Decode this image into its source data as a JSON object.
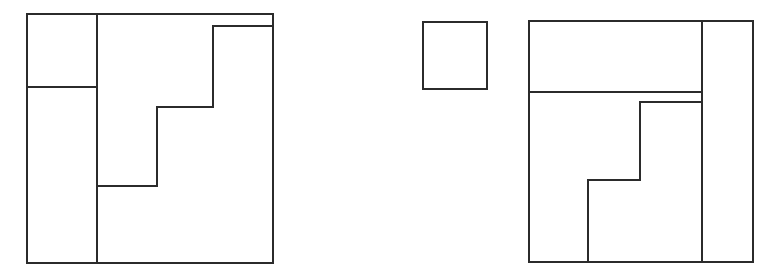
{
  "page": {
    "background_color": "#ffffff",
    "stroke_color": "#2b2b2b",
    "stroke_width": 2,
    "width": 779,
    "height": 280
  },
  "figures": [
    {
      "id": "left-figure",
      "name": "left-partitioned-square",
      "label": "Left figure: square partitioned into four rectilinear regions",
      "outer_rect": {
        "x": 27,
        "y": 14,
        "width": 246,
        "height": 249
      },
      "regions": [
        {
          "name": "top-left-small-rectangle",
          "x": 27,
          "y": 14,
          "width": 70,
          "height": 73
        },
        {
          "name": "left-tall-rectangle",
          "x": 27,
          "y": 87,
          "width": 70,
          "height": 176
        },
        {
          "name": "staircase-left-region",
          "x": 97,
          "y": 14,
          "width": 116,
          "height": 249
        },
        {
          "name": "staircase-right-region",
          "x": 213,
          "y": 26,
          "width": 60,
          "height": 237
        }
      ],
      "interior_segments": [
        {
          "name": "vertical-divider-main",
          "x1": 97,
          "y1": 14,
          "x2": 97,
          "y2": 263
        },
        {
          "name": "horizontal-divider-left",
          "x1": 27,
          "y1": 87,
          "x2": 97,
          "y2": 87
        },
        {
          "name": "step-top-horizontal",
          "x1": 213,
          "y1": 26,
          "x2": 273,
          "y2": 26
        },
        {
          "name": "step-upper-vertical",
          "x1": 213,
          "y1": 26,
          "x2": 213,
          "y2": 107
        },
        {
          "name": "step-middle-horizontal",
          "x1": 157,
          "y1": 107,
          "x2": 213,
          "y2": 107
        },
        {
          "name": "step-lower-vertical",
          "x1": 157,
          "y1": 107,
          "x2": 157,
          "y2": 186
        },
        {
          "name": "step-bottom-horizontal",
          "x1": 97,
          "y1": 186,
          "x2": 157,
          "y2": 186
        }
      ]
    },
    {
      "id": "right-small-square",
      "name": "detached-small-square",
      "label": "Small detached square",
      "outer_rect": {
        "x": 423,
        "y": 22,
        "width": 64,
        "height": 67
      },
      "regions": [
        {
          "name": "small-square-region",
          "x": 423,
          "y": 22,
          "width": 64,
          "height": 67
        }
      ],
      "interior_segments": []
    },
    {
      "id": "right-figure",
      "name": "right-partitioned-square",
      "label": "Right figure: square partitioned into rectilinear regions",
      "outer_rect": {
        "x": 529,
        "y": 21,
        "width": 224,
        "height": 241
      },
      "regions": [
        {
          "name": "top-wide-rectangle",
          "x": 529,
          "y": 21,
          "width": 173,
          "height": 71
        },
        {
          "name": "right-tall-rectangle",
          "x": 702,
          "y": 21,
          "width": 51,
          "height": 241
        },
        {
          "name": "middle-staircase-region",
          "x": 529,
          "y": 92,
          "width": 173,
          "height": 170
        },
        {
          "name": "bottom-left-region",
          "x": 529,
          "y": 92,
          "width": 59,
          "height": 170
        }
      ],
      "interior_segments": [
        {
          "name": "vertical-divider-right",
          "x1": 702,
          "y1": 21,
          "x2": 702,
          "y2": 262
        },
        {
          "name": "horizontal-divider-top",
          "x1": 529,
          "y1": 92,
          "x2": 702,
          "y2": 92
        },
        {
          "name": "step-upper-horizontal",
          "x1": 640,
          "y1": 102,
          "x2": 702,
          "y2": 102
        },
        {
          "name": "step-upper-vertical-right",
          "x1": 640,
          "y1": 102,
          "x2": 640,
          "y2": 180
        },
        {
          "name": "step-lower-horizontal",
          "x1": 588,
          "y1": 180,
          "x2": 640,
          "y2": 180
        },
        {
          "name": "step-lower-vertical-left",
          "x1": 588,
          "y1": 180,
          "x2": 588,
          "y2": 262
        }
      ]
    }
  ]
}
